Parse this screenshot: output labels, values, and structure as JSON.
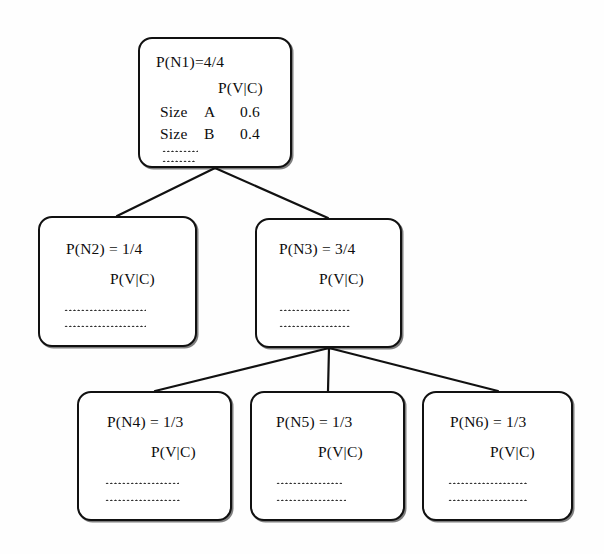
{
  "diagram": {
    "pvc_label": "P(V|C)",
    "line_color": "#111111",
    "node_border_color": "#111111",
    "background_color": "#ffffff",
    "nodes": [
      {
        "id": "n1",
        "title": "P(N1)=4/4",
        "pvc": "P(V|C)",
        "rows": [
          {
            "label": "Size",
            "category": "A",
            "value": "0.6"
          },
          {
            "label": "Size",
            "category": "B",
            "value": "0.4"
          }
        ],
        "ellipsis_rows": 2
      },
      {
        "id": "n2",
        "title": "P(N2) = 1/4",
        "pvc": "P(V|C)",
        "rows": [],
        "ellipsis_rows": 2
      },
      {
        "id": "n3",
        "title": "P(N3) = 3/4",
        "pvc": "P(V|C)",
        "rows": [],
        "ellipsis_rows": 2
      },
      {
        "id": "n4",
        "title": "P(N4) = 1/3",
        "pvc": "P(V|C)",
        "rows": [],
        "ellipsis_rows": 2
      },
      {
        "id": "n5",
        "title": "P(N5) = 1/3",
        "pvc": "P(V|C)",
        "rows": [],
        "ellipsis_rows": 2
      },
      {
        "id": "n6",
        "title": "P(N6) = 1/3",
        "pvc": "P(V|C)",
        "rows": [],
        "ellipsis_rows": 2
      }
    ],
    "edges": [
      {
        "from": "n1",
        "to": "n2"
      },
      {
        "from": "n1",
        "to": "n3"
      },
      {
        "from": "n3",
        "to": "n4"
      },
      {
        "from": "n3",
        "to": "n5"
      },
      {
        "from": "n3",
        "to": "n6"
      }
    ]
  }
}
